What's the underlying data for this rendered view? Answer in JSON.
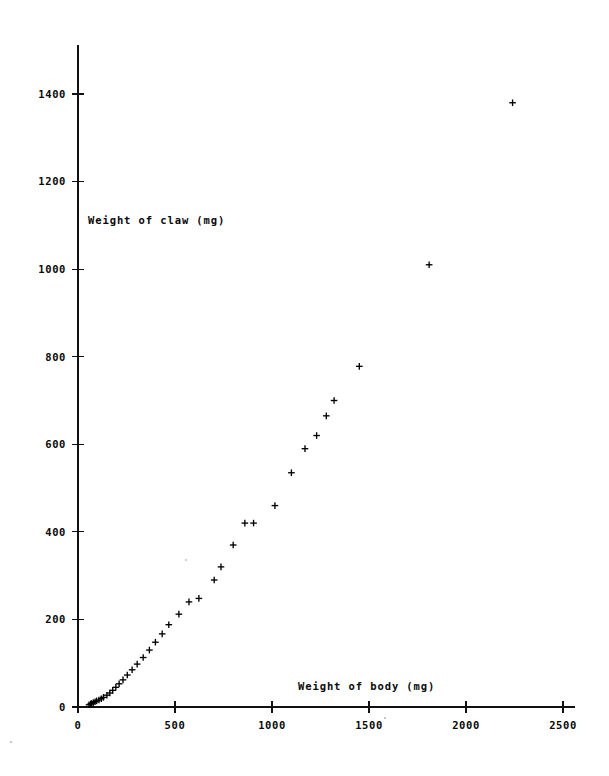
{
  "chart_data": {
    "type": "scatter",
    "title": "",
    "subtitle": "",
    "xlabel": "Weight of body (mg)",
    "ylabel": "Weight of claw (mg)",
    "ylabel_placement": "inside-upper-left",
    "xlabel_placement": "inside-lower-right",
    "xlim": [
      0,
      2500
    ],
    "ylim": [
      0,
      1500
    ],
    "xticks": [
      0,
      500,
      1000,
      1500,
      2000,
      2500
    ],
    "yticks": [
      0,
      200,
      400,
      600,
      800,
      1000,
      1200,
      1400
    ],
    "xticklabels": [
      "0",
      "500",
      "1000",
      "1500",
      "2000",
      "2500"
    ],
    "yticklabels": [
      "0",
      "200",
      "400",
      "600",
      "800",
      "1000",
      "1200",
      "1400"
    ],
    "grid": false,
    "legend": false,
    "legend_position": "none",
    "marker": "plus",
    "marker_color": "#000000",
    "axis_color": "#111111",
    "background": "#ffffff",
    "series": [
      {
        "name": "crab claw vs body weight",
        "x": [
          57,
          65,
          70,
          79,
          88,
          96,
          108,
          120,
          131,
          149,
          164,
          179,
          195,
          212,
          232,
          254,
          279,
          305,
          336,
          368,
          399,
          434,
          468,
          520,
          572,
          623,
          702,
          737,
          800,
          860,
          905,
          1015,
          1100,
          1170,
          1230,
          1280,
          1320,
          1450,
          1810,
          2240
        ],
        "y": [
          5,
          7,
          8,
          10,
          12,
          14,
          16,
          19,
          22,
          27,
          32,
          38,
          45,
          53,
          62,
          73,
          85,
          98,
          113,
          130,
          148,
          167,
          188,
          212,
          240,
          248,
          290,
          320,
          370,
          420,
          420,
          460,
          535,
          590,
          620,
          665,
          700,
          778,
          1010,
          1380
        ]
      }
    ]
  },
  "axes": {
    "y_title": "Weight of claw (mg)",
    "x_title": "Weight of body (mg)"
  },
  "figure": {
    "caption": ""
  }
}
